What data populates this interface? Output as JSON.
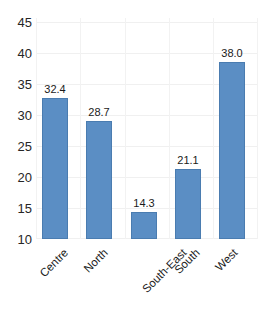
{
  "chart_data": {
    "type": "bar",
    "title": "",
    "subtitle": "",
    "xlabel": "",
    "ylabel": "",
    "categories": [
      "Centre",
      "North",
      "South-East",
      "South",
      "West"
    ],
    "values": [
      32.4,
      28.7,
      14.3,
      21.1,
      38.0
    ],
    "value_labels": [
      "32.4",
      "28.7",
      "14.3",
      "21.1",
      "38.0"
    ],
    "ylim": [
      10,
      45
    ],
    "ytick_labels": [
      "45",
      "40",
      "35",
      "30",
      "25",
      "20",
      "15",
      "10"
    ],
    "ytick_values": [
      45,
      40,
      35,
      30,
      25,
      20,
      15,
      10
    ],
    "grid": {
      "horizontal": true,
      "vertical": true
    },
    "legend": {
      "visible": false,
      "position": "none",
      "entries": []
    },
    "series": [
      {
        "name": "",
        "values": [
          32.4,
          28.7,
          14.3,
          21.1,
          38.0
        ],
        "color": "#5b8ec4"
      }
    ],
    "annotations": []
  },
  "style": {
    "bar_fill": "#5b8ec4",
    "bar_border": "#4a7cb0",
    "grid_color": "#f0f0f0",
    "text_color": "#262626",
    "background": "#ffffff"
  }
}
